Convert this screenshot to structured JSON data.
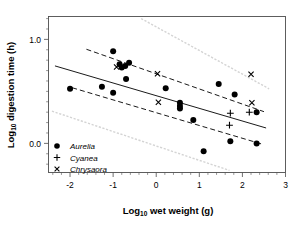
{
  "chart_data": {
    "type": "scatter",
    "title": "",
    "xlabel": "Log10 wet weight (g)",
    "ylabel": "Log10 digestion time (h)",
    "xlabel_base": "Log",
    "xlabel_sub": "10",
    "xlabel_rest": " wet weight (g)",
    "ylabel_base": "Log",
    "ylabel_sub": "10",
    "ylabel_rest": " digestion time (h)",
    "xlim": [
      -2.5,
      3.0
    ],
    "ylim": [
      -0.28,
      1.22
    ],
    "xticks": [
      -2,
      -1,
      0,
      1,
      2,
      3
    ],
    "xtick_labels": [
      "-2",
      "-1",
      "0",
      "1",
      "2",
      "3"
    ],
    "yticks": [
      0.0,
      1.0
    ],
    "ytick_labels": [
      "0.0",
      "1.0"
    ],
    "minor_ticks_per_interval": 5,
    "grid": false,
    "legend_position": "bottom-left",
    "series": [
      {
        "name": "Aurelia",
        "marker": "filled-circle",
        "color": "#000000",
        "points": [
          [
            -2.0,
            0.525
          ],
          [
            -1.26,
            0.545
          ],
          [
            -1.0,
            0.488
          ],
          [
            -1.0,
            0.885
          ],
          [
            -0.85,
            0.76
          ],
          [
            -0.8,
            0.73
          ],
          [
            -0.72,
            0.745
          ],
          [
            -0.63,
            0.775
          ],
          [
            -0.7,
            0.62
          ],
          [
            0.22,
            0.53
          ],
          [
            0.55,
            0.39
          ],
          [
            0.55,
            0.36
          ],
          [
            0.55,
            0.335
          ],
          [
            0.86,
            0.225
          ],
          [
            1.1,
            -0.075
          ],
          [
            1.45,
            0.57
          ],
          [
            1.72,
            0.02
          ],
          [
            1.82,
            0.47
          ],
          [
            2.33,
            0.3
          ],
          [
            2.33,
            0.0
          ]
        ]
      },
      {
        "name": "Cyanea",
        "marker": "plus",
        "color": "#000000",
        "points": [
          [
            1.7,
            0.175
          ],
          [
            1.72,
            0.29
          ],
          [
            2.16,
            0.3
          ]
        ]
      },
      {
        "name": "Chrysaora",
        "marker": "cross",
        "color": "#000000",
        "points": [
          [
            -0.92,
            0.735
          ],
          [
            0.03,
            0.67
          ],
          [
            0.05,
            0.395
          ],
          [
            2.2,
            0.665
          ],
          [
            2.22,
            0.39
          ]
        ]
      }
    ],
    "lines": [
      {
        "name": "regression-fit",
        "style": "solid",
        "color": "#000000",
        "x": [
          -2.35,
          2.55
        ],
        "y": [
          0.745,
          0.148
        ]
      },
      {
        "name": "confidence-upper",
        "style": "dashed",
        "color": "#000000",
        "x": [
          -1.62,
          2.5
        ],
        "y": [
          0.905,
          0.305
        ]
      },
      {
        "name": "confidence-lower",
        "style": "dashed",
        "color": "#000000",
        "x": [
          -1.95,
          2.48
        ],
        "y": [
          0.535,
          -0.01
        ]
      },
      {
        "name": "prediction-upper",
        "style": "dotted",
        "color": "#d4d4d4",
        "x": [
          -0.35,
          2.62
        ],
        "y": [
          1.2,
          0.525
        ]
      },
      {
        "name": "prediction-lower",
        "style": "dotted",
        "color": "#d4d4d4",
        "x": [
          -2.42,
          1.7
        ],
        "y": [
          0.31,
          -0.26
        ]
      }
    ]
  },
  "legend": {
    "items": [
      {
        "label": "Aurelia",
        "marker": "filled-circle"
      },
      {
        "label": "Cyanea",
        "marker": "plus"
      },
      {
        "label": "Chrysaora",
        "marker": "cross"
      }
    ]
  }
}
